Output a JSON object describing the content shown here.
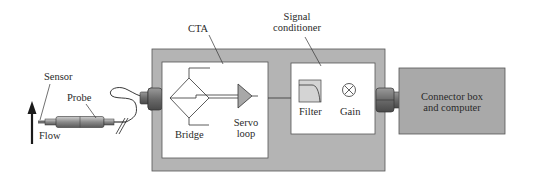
{
  "diagram": {
    "labels": {
      "sensor": "Sensor",
      "probe": "Probe",
      "flow": "Flow",
      "cta": "CTA",
      "bridge": "Bridge",
      "servo_line1": "Servo",
      "servo_line2": "loop",
      "signal_line1": "Signal",
      "signal_line2": "conditioner",
      "filter": "Filter",
      "gain": "Gain",
      "connector_line1": "Connector box",
      "connector_line2": "and computer"
    },
    "nodes": [
      {
        "id": "sensor",
        "label": "Sensor"
      },
      {
        "id": "probe",
        "label": "Probe"
      },
      {
        "id": "cta",
        "label": "CTA",
        "children": [
          "bridge",
          "servo-loop"
        ]
      },
      {
        "id": "signal-conditioner",
        "label": "Signal conditioner",
        "children": [
          "filter",
          "gain"
        ]
      },
      {
        "id": "connector-box",
        "label": "Connector box and computer"
      }
    ],
    "edges": [
      {
        "from": "probe",
        "to": "cta",
        "type": "cable"
      },
      {
        "from": "bridge",
        "to": "servo-loop"
      },
      {
        "from": "servo-loop",
        "to": "signal-conditioner"
      },
      {
        "from": "signal-conditioner",
        "to": "connector-box",
        "type": "connector"
      }
    ],
    "colors": {
      "housing_gray": "#b4b4b4",
      "box_gray": "#a9a9a9",
      "white": "#ffffff",
      "line": "#333333"
    }
  }
}
